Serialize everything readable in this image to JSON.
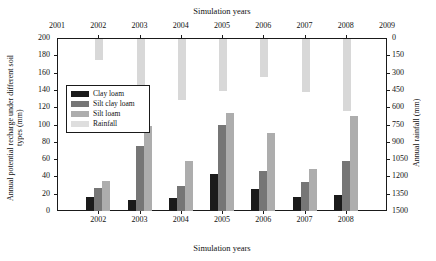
{
  "chart_data": {
    "type": "bar",
    "title": "",
    "xlabel": "Simulation years",
    "xlabel_top": "Simulation years",
    "ylabel": "Annual potential recharge under different soil types (mm)",
    "ylabel_right": "Annual rainfall (mm)",
    "categories": [
      "2002",
      "2003",
      "2004",
      "2005",
      "2006",
      "2007",
      "2008"
    ],
    "top_axis_ticks": [
      "2001",
      "2002",
      "2003",
      "2004",
      "2005",
      "2006",
      "2007",
      "2008",
      "2009"
    ],
    "left_ticks": [
      "200",
      "180",
      "160",
      "140",
      "120",
      "100",
      "80",
      "60",
      "40",
      "20",
      "0"
    ],
    "right_ticks": [
      "0",
      "150",
      "300",
      "450",
      "600",
      "750",
      "900",
      "1050",
      "1200",
      "1350",
      "1500"
    ],
    "ylim": [
      0,
      200
    ],
    "ylim_right": [
      0,
      1500
    ],
    "right_axis_inverted": true,
    "grid": false,
    "legend_position": "upper-left-inside",
    "series": [
      {
        "name": "Clay loam",
        "color": "#1b1b1b",
        "axis": "left",
        "values": [
          16,
          13,
          15,
          43,
          26,
          16,
          19
        ]
      },
      {
        "name": "Silt clay loam",
        "color": "#767676",
        "axis": "left",
        "values": [
          27,
          75,
          29,
          100,
          46,
          34,
          58
        ]
      },
      {
        "name": "Silt loam",
        "color": "#adadad",
        "axis": "left",
        "values": [
          35,
          98,
          58,
          113,
          90,
          48,
          110
        ]
      },
      {
        "name": "Rainfall",
        "color": "#d8d8d8",
        "axis": "right",
        "values": [
          180,
          630,
          530,
          450,
          330,
          460,
          620
        ]
      }
    ]
  },
  "legend": {
    "items": [
      {
        "label": "Clay loam"
      },
      {
        "label": "Silt clay loam"
      },
      {
        "label": "Silt loam"
      },
      {
        "label": "Rainfall"
      }
    ]
  }
}
